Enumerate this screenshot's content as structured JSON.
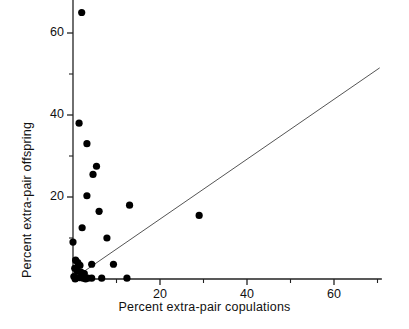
{
  "chart_data": {
    "type": "scatter",
    "title": "",
    "xlabel": "Percent extra-pair copulations",
    "ylabel": "Percent extra-pair offspring",
    "xlim": [
      0,
      71
    ],
    "ylim": [
      0,
      84
    ],
    "xticks": [
      20,
      40,
      60
    ],
    "xtick_labels": [
      "20",
      "40",
      "60"
    ],
    "xminor_ticks": [
      10,
      30,
      50,
      70
    ],
    "yticks": [
      20,
      40,
      60,
      80
    ],
    "ytick_labels": [
      "20",
      "40",
      "60",
      "80"
    ],
    "yminor_ticks": [
      10,
      30,
      50,
      70
    ],
    "grid": false,
    "legend": null,
    "marker": "filled-circle",
    "marker_color": "#000000",
    "points": [
      {
        "x": 9.5,
        "y": 76.0
      },
      {
        "x": 2.0,
        "y": 65.0
      },
      {
        "x": 1.4,
        "y": 38.0
      },
      {
        "x": 3.2,
        "y": 33.0
      },
      {
        "x": 5.4,
        "y": 27.5
      },
      {
        "x": 4.6,
        "y": 25.5
      },
      {
        "x": 3.2,
        "y": 20.3
      },
      {
        "x": 6.0,
        "y": 16.5
      },
      {
        "x": 13.0,
        "y": 18.0
      },
      {
        "x": 29.0,
        "y": 15.5
      },
      {
        "x": 2.1,
        "y": 12.5
      },
      {
        "x": 7.8,
        "y": 10.0
      },
      {
        "x": 0.0,
        "y": 9.0
      },
      {
        "x": 0.6,
        "y": 4.6
      },
      {
        "x": 1.1,
        "y": 4.0
      },
      {
        "x": 1.6,
        "y": 3.3
      },
      {
        "x": 0.4,
        "y": 2.6
      },
      {
        "x": 1.0,
        "y": 1.9
      },
      {
        "x": 1.9,
        "y": 1.6
      },
      {
        "x": 2.6,
        "y": 1.3
      },
      {
        "x": 4.3,
        "y": 3.6
      },
      {
        "x": 9.3,
        "y": 3.6
      },
      {
        "x": 0.2,
        "y": 0.6
      },
      {
        "x": 0.9,
        "y": 0.3
      },
      {
        "x": 1.5,
        "y": 0.3
      },
      {
        "x": 2.3,
        "y": 0.2
      },
      {
        "x": 3.4,
        "y": 0.2
      },
      {
        "x": 4.3,
        "y": 0.2
      },
      {
        "x": 6.6,
        "y": 0.2
      },
      {
        "x": 12.4,
        "y": 0.2
      },
      {
        "x": 0.5,
        "y": 0.0
      },
      {
        "x": 2.9,
        "y": 0.0
      }
    ],
    "reference_line": {
      "label": "",
      "x_start": 0.0,
      "y_start": 0.0,
      "x_end": 70.5,
      "y_end": 51.5,
      "style": "solid",
      "color": "#555555"
    },
    "axis_color": "#222222"
  }
}
